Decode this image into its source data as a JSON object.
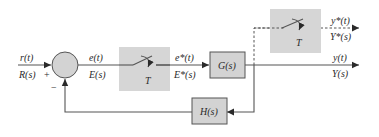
{
  "diagram": {
    "type": "sampled-data closed-loop control block diagram",
    "input": {
      "time_label": "r(t)",
      "s_label": "R(s)"
    },
    "summing_junction": {
      "plus_sign": "+",
      "minus_sign": "−"
    },
    "error": {
      "time_label": "e(t)",
      "s_label": "E(s)"
    },
    "sampler_1": {
      "period_label": "T"
    },
    "sampled_error": {
      "time_label": "e*(t)",
      "s_label": "E*(s)"
    },
    "forward_block": {
      "label": "G(s)"
    },
    "output": {
      "time_label": "y(t)",
      "s_label": "Y(s)"
    },
    "sampler_2": {
      "period_label": "T"
    },
    "sampled_output": {
      "time_label": "y*(t)",
      "s_label": "Y*(s)"
    },
    "feedback_block": {
      "label": "H(s)"
    },
    "colors": {
      "block_fill": "#d3d3d3",
      "line": "#555555",
      "text": "#2a2a2a"
    }
  }
}
